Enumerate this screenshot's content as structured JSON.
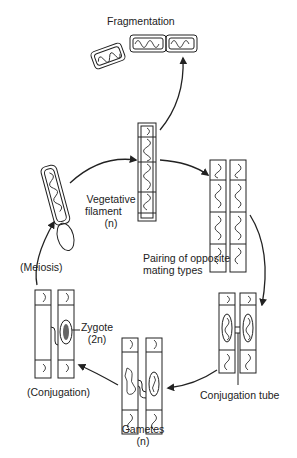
{
  "diagram": {
    "stages": [
      {
        "id": "fragmentation",
        "label": "Fragmentation"
      },
      {
        "id": "vegetative",
        "label_line1": "Vegetative",
        "label_line2": "filament",
        "label_line3": "(n)"
      },
      {
        "id": "pairing",
        "label_line1": "Pairing of opposite",
        "label_line2": "mating types"
      },
      {
        "id": "conjugation-tube",
        "label": "Conjugation tube"
      },
      {
        "id": "gametes",
        "label_line1": "Gametes",
        "label_line2": "(n)"
      },
      {
        "id": "conjugation",
        "label": "(Conjugation)"
      },
      {
        "id": "zygote",
        "label_line1": "Zygote",
        "label_line2": "(2n)"
      },
      {
        "id": "meiosis",
        "label": "(Meiosis)"
      }
    ],
    "colors": {
      "ink": "#222222",
      "background": "#ffffff"
    }
  }
}
